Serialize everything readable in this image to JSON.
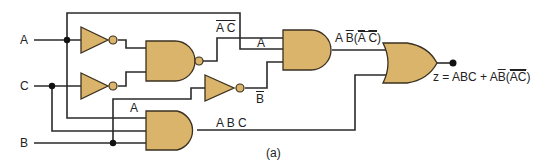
{
  "diagram": {
    "type": "logic-circuit",
    "caption": "(a)",
    "inputs": [
      {
        "name": "A",
        "label": "A"
      },
      {
        "name": "C",
        "label": "C"
      },
      {
        "name": "B",
        "label": "B"
      }
    ],
    "gates": [
      {
        "id": "inv1",
        "type": "NOT",
        "input": "A",
        "output": "A'"
      },
      {
        "id": "inv2",
        "type": "NOT",
        "input": "C",
        "output": "C'"
      },
      {
        "id": "nand1",
        "type": "NAND",
        "inputs": [
          "A'",
          "C'"
        ],
        "output": "NOT(A' C')"
      },
      {
        "id": "inv3",
        "type": "NOT",
        "input": "B",
        "output": "B'"
      },
      {
        "id": "and1",
        "type": "AND",
        "inputs": [
          "NOT(A' C')",
          "A",
          "B'"
        ],
        "output": "A B'(NOT(A' C'))"
      },
      {
        "id": "and2",
        "type": "AND",
        "inputs": [
          "A",
          "C",
          "B"
        ],
        "output": "ABC"
      },
      {
        "id": "or1",
        "type": "OR",
        "inputs": [
          "A B'(NOT(A' C'))",
          "ABC"
        ],
        "output": "z"
      }
    ],
    "labels": {
      "input_a": "A",
      "input_c": "C",
      "input_b": "B",
      "nand_out_a": "A",
      "nand_out_c": "C",
      "and1_in_a": "A",
      "inv_b_out": "B",
      "and1_out_a": "A",
      "and1_out_b": "B",
      "and1_out_paren_open": "(",
      "and1_out_ac_a": "A",
      "and1_out_ac_c": "C",
      "and1_out_paren_close": ")",
      "and2_in_a": "A",
      "and2_out": "A B C",
      "output_eq_prefix": "z = ABC + A",
      "output_eq_b": "B",
      "output_eq_paren_open": "(",
      "output_eq_ac": "AC",
      "output_eq_paren_close": ")",
      "caption": "(a)"
    },
    "colors": {
      "gate_fill": "#d9b46a",
      "gate_stroke": "#3a3020",
      "wire": "#2a2a2a",
      "background": "#ffffff"
    }
  }
}
